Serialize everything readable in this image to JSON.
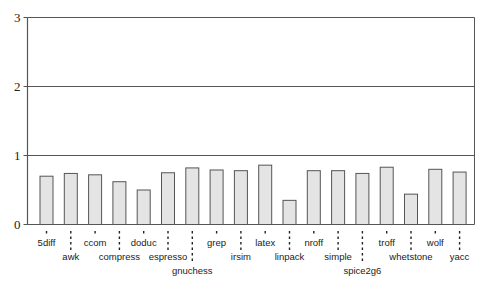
{
  "chart_data": {
    "type": "bar",
    "title": "",
    "xlabel": "",
    "ylabel": "",
    "ylim": [
      0,
      3
    ],
    "yticks": [
      0,
      1,
      2,
      3
    ],
    "grid": "horizontal at 1, 2, 3",
    "legend": null,
    "categories": [
      "5diff",
      "awk",
      "ccom",
      "compress",
      "doduc",
      "espresso",
      "gnuchess",
      "grep",
      "irsim",
      "latex",
      "linpack",
      "nroff",
      "simple",
      "spice2g6",
      "troff",
      "whetstone",
      "wolf",
      "yacc"
    ],
    "values": [
      0.7,
      0.74,
      0.72,
      0.62,
      0.5,
      0.75,
      0.82,
      0.79,
      0.78,
      0.86,
      0.35,
      0.78,
      0.78,
      0.74,
      0.83,
      0.44,
      0.8,
      0.76
    ],
    "label_rows": [
      0,
      1,
      0,
      1,
      0,
      1,
      2,
      0,
      1,
      0,
      1,
      0,
      1,
      2,
      0,
      1,
      0,
      1
    ],
    "colors": {
      "bar_fill": "#e4e4e4",
      "bar_stroke": "#555555",
      "axis": "#555555",
      "grid": "#555555"
    }
  }
}
